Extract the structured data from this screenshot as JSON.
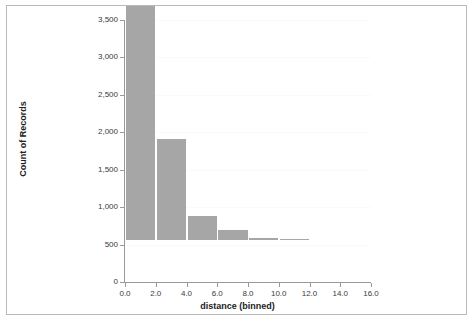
{
  "chart_data": {
    "type": "bar",
    "title": "",
    "subtitle": "",
    "xlabel": "distance (binned)",
    "ylabel": "Count of Records",
    "categories": [
      "0.0",
      "2.0",
      "4.0",
      "6.0",
      "8.0",
      "10.0",
      "12.0",
      "14.0"
    ],
    "bin_starts": [
      0,
      2,
      4,
      6,
      8,
      10,
      12,
      14
    ],
    "bin_width": 2,
    "values": [
      3125,
      1355,
      320,
      130,
      30,
      5,
      0,
      0
    ],
    "xlim": [
      0,
      16
    ],
    "ylim": [
      0,
      3500
    ],
    "x_ticks": [
      "0.0",
      "2.0",
      "4.0",
      "6.0",
      "8.0",
      "10.0",
      "12.0",
      "14.0",
      "16.0"
    ],
    "x_tick_values": [
      0,
      2,
      4,
      6,
      8,
      10,
      12,
      14,
      16
    ],
    "y_ticks": [
      "0",
      "500",
      "1,000",
      "1,500",
      "2,000",
      "2,500",
      "3,000",
      "3,500"
    ],
    "y_tick_values": [
      0,
      500,
      1000,
      1500,
      2000,
      2500,
      3000,
      3500
    ],
    "grid": true,
    "legend": "none",
    "bar_color": "#a6a6a6",
    "axis_color": "#9a9a9a",
    "text_color": "#3a3a3a",
    "background": "#ffffff",
    "border_color": "#b9b9b9"
  }
}
